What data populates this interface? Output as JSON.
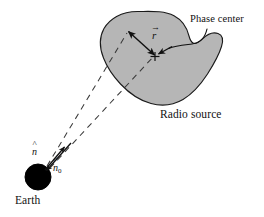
{
  "figure": {
    "background_color": "#ffffff",
    "width": 264,
    "height": 217
  },
  "labels": {
    "phase_center": "Phase center",
    "radio_source": "Radio source",
    "earth": "Earth"
  },
  "vectors": {
    "r": {
      "symbol": "r",
      "accent": "→",
      "description": "offset vector from phase center to point in source"
    },
    "n": {
      "symbol": "n",
      "accent": "^",
      "subscript": "",
      "description": "unit vector toward point in source"
    },
    "n0": {
      "symbol": "n",
      "accent": "^",
      "subscript": "0",
      "description": "unit vector toward phase center"
    }
  },
  "shapes": {
    "radio_source_blob": {
      "fill": "#b6b6b6",
      "stroke": "#1a1a1a",
      "stroke_width": 1.1
    },
    "earth": {
      "fill": "#000000",
      "stroke": "#000000",
      "cx": 38,
      "cy": 177,
      "r": 13
    },
    "phase_center_marker": {
      "glyph": "+",
      "x": 155,
      "y": 56
    },
    "sight_lines": {
      "style": "dashed",
      "stroke": "#3a3a3a",
      "count": 2
    }
  },
  "colors": {
    "ink": "#111111",
    "blob_fill": "#b6b6b6",
    "blob_stroke": "#1a1a1a",
    "dashed_line": "#3a3a3a",
    "earth_fill": "#000000"
  }
}
